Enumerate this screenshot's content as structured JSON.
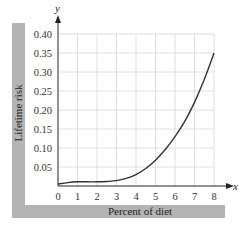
{
  "chart_data": {
    "type": "line",
    "title": "",
    "xlabel": "Percent of diet",
    "ylabel": "Lifetime risk",
    "x_axis_var": "x",
    "y_axis_var": "y",
    "xlim": [
      0,
      8
    ],
    "ylim": [
      0,
      0.4
    ],
    "grid": true,
    "x_ticks": [
      "0",
      "1",
      "2",
      "3",
      "4",
      "5",
      "6",
      "7",
      "8"
    ],
    "y_ticks": [
      "0.05",
      "0.10",
      "0.15",
      "0.20",
      "0.25",
      "0.30",
      "0.35",
      "0.40"
    ],
    "series": [
      {
        "name": "Lifetime risk",
        "x": [
          0,
          0.5,
          1,
          1.5,
          2,
          2.5,
          3,
          3.5,
          4,
          4.5,
          5,
          5.5,
          6,
          6.5,
          7,
          7.5,
          8
        ],
        "values": [
          0.005,
          0.009,
          0.011,
          0.011,
          0.011,
          0.012,
          0.014,
          0.02,
          0.03,
          0.046,
          0.068,
          0.096,
          0.13,
          0.17,
          0.22,
          0.28,
          0.35
        ]
      }
    ],
    "colors": {
      "curve": "#333333",
      "grid": "#d8d8d8",
      "axis": "#222222",
      "label_band": "#b4b4b4"
    }
  }
}
